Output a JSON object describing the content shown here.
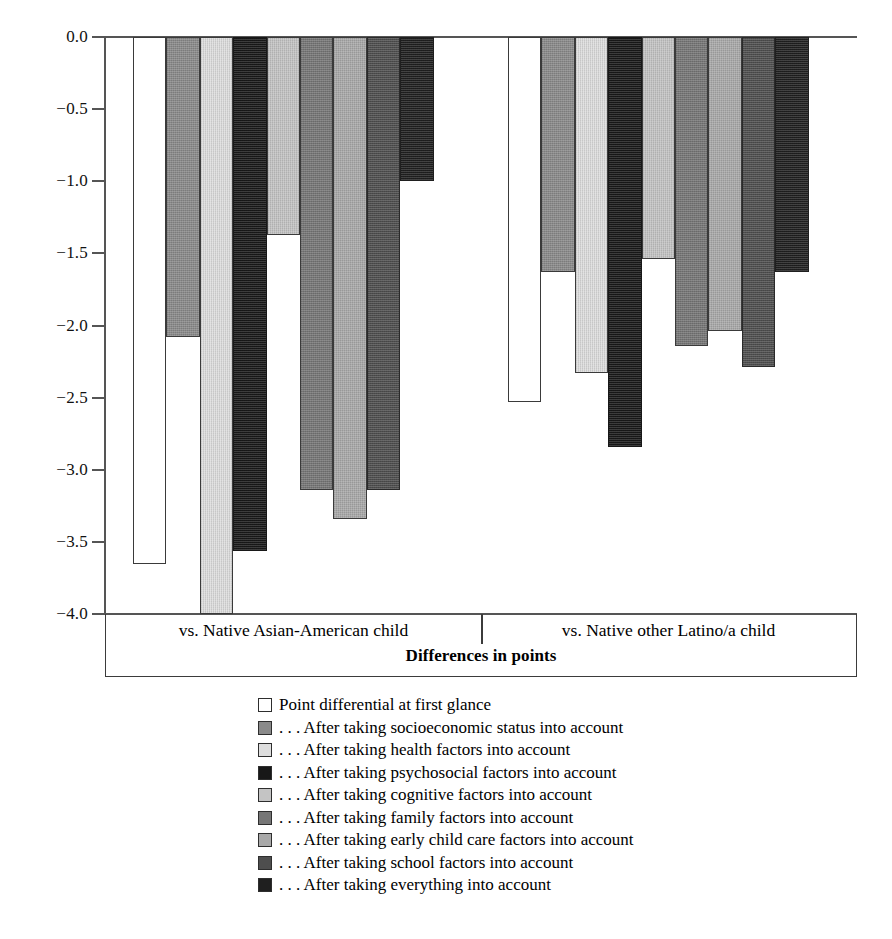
{
  "chart_data": {
    "type": "bar",
    "title": "",
    "xlabel": "Differences in points",
    "ylabel": "",
    "ylim": [
      -4.0,
      0.0
    ],
    "grid": false,
    "legend_position": "bottom",
    "yticks": [
      "0.0",
      "−0.5",
      "−1.0",
      "−1.5",
      "−2.0",
      "−2.5",
      "−3.0",
      "−3.5",
      "−4.0"
    ],
    "ytick_values": [
      0.0,
      -0.5,
      -1.0,
      -1.5,
      -2.0,
      -2.5,
      -3.0,
      -3.5,
      -4.0
    ],
    "categories": [
      "vs. Native Asian-American child",
      "vs. Native other Latino/a child"
    ],
    "series": [
      {
        "name": "Point differential at first glance",
        "values": [
          -3.65,
          -2.53
        ],
        "color": "#ffffff"
      },
      {
        "name": "… After taking socioeconomic status into account",
        "values": [
          -2.08,
          -1.63
        ],
        "color": "#8a8a8a"
      },
      {
        "name": "… After taking health factors into account",
        "values": [
          -4.0,
          -2.33
        ],
        "color": "#dedede"
      },
      {
        "name": "… After taking psychosocial factors into account",
        "values": [
          -3.56,
          -2.84
        ],
        "color": "#181818"
      },
      {
        "name": "… After taking cognitive factors into account",
        "values": [
          -1.37,
          -1.54
        ],
        "color": "#c4c4c4"
      },
      {
        "name": "… After taking family factors into account",
        "values": [
          -3.14,
          -2.14
        ],
        "color": "#767676"
      },
      {
        "name": "… After taking early child care factors into account",
        "values": [
          -3.34,
          -2.04
        ],
        "color": "#a9a9a9"
      },
      {
        "name": "… After taking school factors into account",
        "values": [
          -3.14,
          -2.29
        ],
        "color": "#4e4e4e"
      },
      {
        "name": "… After taking everything into account",
        "values": [
          -1.0,
          -1.63
        ],
        "color": "#1f1f1f"
      }
    ]
  },
  "legend": {
    "items": [
      "Point differential at first glance",
      ". . . After taking socioeconomic status into account",
      ". . . After taking health factors into account",
      ". . . After taking psychosocial factors into account",
      ". . . After taking cognitive factors into account",
      ". . . After taking family factors into account",
      ". . . After taking early child care factors into account",
      ". . . After taking school factors into account",
      ". . . After taking everything into account"
    ]
  }
}
